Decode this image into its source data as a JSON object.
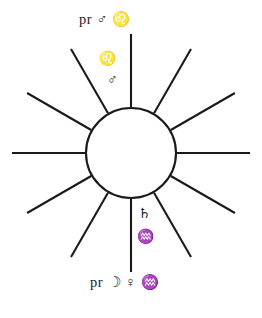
{
  "figure": {
    "name": "Sun radiant astrological diagram",
    "background_color": "#ffffff",
    "stroke_color": "#1a1a1a"
  },
  "diagram": {
    "center_x": 131,
    "center_y": 153,
    "circle_radius": 45,
    "ray_count": 12,
    "ray_angles_deg": [
      0,
      30,
      60,
      90,
      120,
      150,
      180,
      210,
      240,
      270,
      300,
      330
    ],
    "ray_inner_radius": 46,
    "ray_outer_radius": 120
  },
  "annotations": {
    "top_label": {
      "prefix": "pr",
      "symbols": [
        "♂",
        "♌"
      ],
      "text": "pr ♂ ♌",
      "meaning": "progressed Mars in Leo"
    },
    "inner_upper_first": {
      "symbol": "♌",
      "text": "♌",
      "meaning": "Leo"
    },
    "inner_upper_second": {
      "symbol": "♂",
      "text": "♂",
      "meaning": "Mars"
    },
    "inner_lower_first": {
      "symbol": "♄",
      "text": "♄",
      "meaning": "Saturn"
    },
    "inner_lower_second": {
      "symbol": "♒",
      "text": "♒",
      "meaning": "Aquarius"
    },
    "bottom_label": {
      "prefix": "pr",
      "symbols": [
        "☽",
        "♀",
        "♒"
      ],
      "text": "pr ☽ ♀ ♒",
      "meaning": "progressed Moon, Venus in Aquarius"
    }
  }
}
